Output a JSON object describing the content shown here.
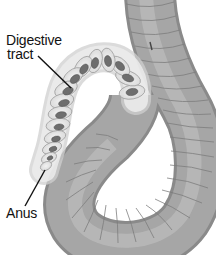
{
  "figure": {
    "labels": [
      {
        "id": "digestive-tract",
        "lines": [
          "Digestive",
          "tract"
        ]
      },
      {
        "id": "anus",
        "lines": [
          "Anus"
        ]
      }
    ]
  },
  "colors": {
    "background": "#ffffff",
    "body_fill": "#a9a9a9",
    "body_highlight": "#c8c8c8",
    "body_shadow": "#8a8a8a",
    "segment_line": "#7d7d7d",
    "cutaway_fill": "#e9e9e9",
    "gut_fill": "#6f6f6f",
    "label_text": "#111111",
    "leader_line": "#111111"
  }
}
